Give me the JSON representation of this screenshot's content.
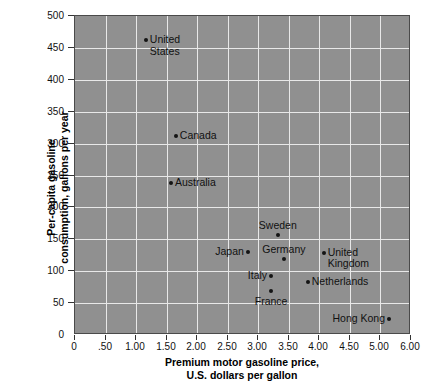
{
  "chart_data": {
    "type": "scatter",
    "title": "",
    "xlabel": "Premium motor gasoline price,\nU.S. dollars per gallon",
    "xlabel_line1": "Premium motor gasoline price,",
    "xlabel_line2": "U.S. dollars per gallon",
    "ylabel": "Per-capita gasoline consumption, gallons per year",
    "ylabel_line1": "Per-capita gasoline",
    "ylabel_line2": "consumption, gallons per year",
    "xlim": [
      0,
      5.5
    ],
    "ylim": [
      0,
      500
    ],
    "grid": true,
    "legend": "none",
    "plot_background": "#909090",
    "gridline_color": "#e8e8e8",
    "point_color": "#141414",
    "xticks": [
      0,
      0.5,
      1.0,
      1.5,
      2.0,
      2.5,
      3.0,
      3.5,
      4.0,
      4.5,
      5.0,
      5.5
    ],
    "xticklabels": [
      "0",
      ".50",
      "1.00",
      "1.50",
      "2.00",
      "2.50",
      "3.00",
      "3.50",
      "4.00",
      "4.50",
      "5.00",
      "6.00"
    ],
    "yticks": [
      0,
      50,
      100,
      150,
      200,
      250,
      300,
      350,
      400,
      450,
      500
    ],
    "yticklabels": [
      "0",
      "50",
      "100",
      "150",
      "200",
      "250",
      "300",
      "350",
      "400",
      "450",
      "500"
    ],
    "points": [
      {
        "name": "United States",
        "label_line1": "United",
        "label_line2": "States",
        "x": 1.16,
        "y": 462,
        "label_pos": "right"
      },
      {
        "name": "Canada",
        "label_line1": "Canada",
        "label_line2": "",
        "x": 1.65,
        "y": 312,
        "label_pos": "right"
      },
      {
        "name": "Australia",
        "label_line1": "Australia",
        "label_line2": "",
        "x": 1.57,
        "y": 238,
        "label_pos": "right"
      },
      {
        "name": "Sweden",
        "label_line1": "Sweden",
        "label_line2": "",
        "x": 3.32,
        "y": 157,
        "label_pos": "above"
      },
      {
        "name": "Japan",
        "label_line1": "Japan",
        "label_line2": "",
        "x": 2.83,
        "y": 130,
        "label_pos": "left"
      },
      {
        "name": "Germany",
        "label_line1": "Germany",
        "label_line2": "",
        "x": 3.42,
        "y": 119,
        "label_pos": "above"
      },
      {
        "name": "United Kingdom",
        "label_line1": "United",
        "label_line2": "Kingdom",
        "x": 4.07,
        "y": 129,
        "label_pos": "right"
      },
      {
        "name": "Italy",
        "label_line1": "Italy",
        "label_line2": "",
        "x": 3.21,
        "y": 92,
        "label_pos": "left"
      },
      {
        "name": "Netherlands",
        "label_line1": "Netherlands",
        "label_line2": "",
        "x": 3.81,
        "y": 83,
        "label_pos": "right"
      },
      {
        "name": "France",
        "label_line1": "France",
        "label_line2": "",
        "x": 3.21,
        "y": 69,
        "label_pos": "below"
      },
      {
        "name": "Hong Kong",
        "label_line1": "Hong Kong",
        "label_line2": "",
        "x": 5.14,
        "y": 25,
        "label_pos": "left"
      }
    ]
  }
}
